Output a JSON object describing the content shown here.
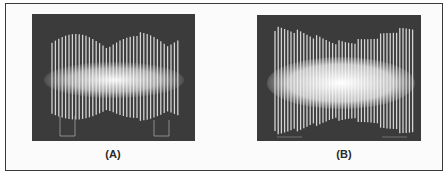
{
  "figure": {
    "panels": [
      {
        "id": "A",
        "label": "(A)",
        "description": "Oscilloscope trace of amplitude-modulated signal with deep envelope dips (two lobes)",
        "envelope": "deep-modulation"
      },
      {
        "id": "B",
        "label": "(B)",
        "description": "Oscilloscope trace of amplitude-modulated signal with shallow envelope, denser bright core",
        "envelope": "shallow-modulation"
      }
    ]
  },
  "colors": {
    "screen_background": "#3b3b3b",
    "trace": "#f2f2f2",
    "frame_border": "#3a3a3a",
    "label_text": "#2a2a2a"
  }
}
